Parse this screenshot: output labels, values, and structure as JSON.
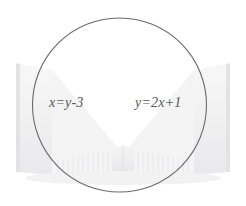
{
  "canvas": {
    "width": 246,
    "height": 206,
    "background_color": "#ffffff"
  },
  "illustration": {
    "name": "open-book-watermark",
    "description": "faint light gray open book with fanned pages behind the circle",
    "page_color": "#f2f2f3",
    "page_edge_color": "#e6e6e8",
    "spine_color": "#ededee"
  },
  "circle": {
    "name": "equation-circle",
    "center_x": 119.5,
    "center_y": 105,
    "radius": 87,
    "stroke_color": "#6a6a6e",
    "stroke_width": 1.1,
    "fill": "none"
  },
  "equations": [
    {
      "id": "eq-left",
      "full_text": "x=y-3",
      "lhs": "x",
      "equals": "=",
      "rhs_var": "y",
      "rhs_op": "−",
      "rhs_num": "3",
      "color": "#55565a"
    },
    {
      "id": "eq-right",
      "full_text": "y=2x+1",
      "lhs": "y",
      "equals": "=",
      "rhs_coef": "2",
      "rhs_var": "x",
      "rhs_op": "+",
      "rhs_num": "1",
      "color": "#55565a"
    }
  ]
}
